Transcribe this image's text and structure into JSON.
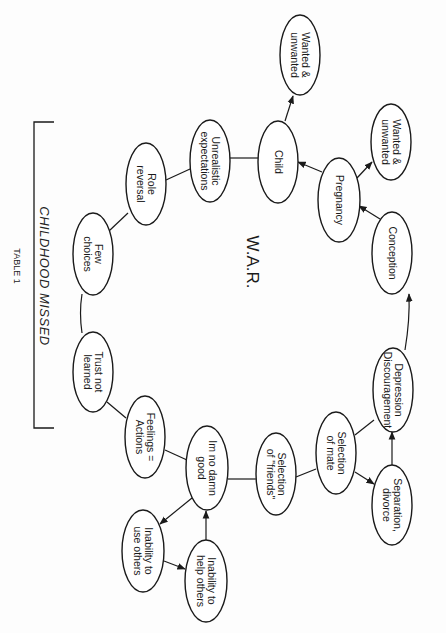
{
  "diagram": {
    "center_label": "W.A.R.",
    "bracket_label": "CHILDHOOD MISSED",
    "table_label": "TABLE 1",
    "colors": {
      "stroke": "#1a1a1a",
      "fill": "#ffffff",
      "background": "#fdfdfd"
    },
    "nodes": [
      {
        "id": "wanted_top",
        "lines": [
          "Wanted &",
          "unwanted"
        ],
        "cx": 300,
        "cy": 55,
        "rx": 20,
        "ry": 40
      },
      {
        "id": "wanted_right",
        "lines": [
          "Wanted &",
          "unwanted"
        ],
        "cx": 391,
        "cy": 142,
        "rx": 20,
        "ry": 38
      },
      {
        "id": "child",
        "lines": [
          "Child"
        ],
        "cx": 278,
        "cy": 162,
        "rx": 20,
        "ry": 41
      },
      {
        "id": "pregnancy",
        "lines": [
          "Pregnancy"
        ],
        "cx": 339,
        "cy": 200,
        "rx": 21,
        "ry": 42
      },
      {
        "id": "conception",
        "lines": [
          "Conception"
        ],
        "cx": 392,
        "cy": 253,
        "rx": 20,
        "ry": 41
      },
      {
        "id": "depression",
        "lines": [
          "Depression",
          "Discouragement"
        ],
        "cx": 393,
        "cy": 390,
        "rx": 20,
        "ry": 42
      },
      {
        "id": "separation",
        "lines": [
          "Separation,",
          "divorce"
        ],
        "cx": 392,
        "cy": 505,
        "rx": 20,
        "ry": 40
      },
      {
        "id": "selection_mate",
        "lines": [
          "Selection",
          "of mate"
        ],
        "cx": 336,
        "cy": 453,
        "rx": 20,
        "ry": 41
      },
      {
        "id": "selection_friends",
        "lines": [
          "Selection",
          "of \"friends\""
        ],
        "cx": 276,
        "cy": 474,
        "rx": 20,
        "ry": 41
      },
      {
        "id": "no_damn_good",
        "lines": [
          "Im no damn",
          "good"
        ],
        "cx": 207,
        "cy": 468,
        "rx": 21,
        "ry": 42
      },
      {
        "id": "inability_help",
        "lines": [
          "Inability  to",
          "help others"
        ],
        "cx": 206,
        "cy": 581,
        "rx": 21,
        "ry": 41
      },
      {
        "id": "inability_use",
        "lines": [
          "Inability to",
          "use others"
        ],
        "cx": 143,
        "cy": 551,
        "rx": 21,
        "ry": 41
      },
      {
        "id": "feelings_actions",
        "lines": [
          "Feelings =",
          "Actions"
        ],
        "cx": 145,
        "cy": 437,
        "rx": 20,
        "ry": 41
      },
      {
        "id": "trust_not_learned",
        "lines": [
          "Trust not",
          "learned"
        ],
        "cx": 93,
        "cy": 372,
        "rx": 20,
        "ry": 40
      },
      {
        "id": "few_choices",
        "lines": [
          "Few",
          "choices"
        ],
        "cx": 93,
        "cy": 254,
        "rx": 20,
        "ry": 41
      },
      {
        "id": "role_reversal",
        "lines": [
          "Role",
          "reversal"
        ],
        "cx": 146,
        "cy": 184,
        "rx": 20,
        "ry": 41
      },
      {
        "id": "unrealistic",
        "lines": [
          "Unrealistic",
          "expectations"
        ],
        "cx": 210,
        "cy": 161,
        "rx": 20,
        "ry": 41
      }
    ],
    "edges": [
      {
        "from": "child",
        "to": "wanted_top",
        "arrow": true,
        "x1": 285,
        "y1": 121,
        "x2": 293,
        "y2": 96
      },
      {
        "from": "pregnancy",
        "to": "wanted_right",
        "arrow": true,
        "x1": 357,
        "y1": 178,
        "x2": 372,
        "y2": 162
      },
      {
        "from": "pregnancy",
        "to": "child",
        "arrow": true,
        "x1": 322,
        "y1": 172,
        "x2": 298,
        "y2": 162
      },
      {
        "from": "conception",
        "to": "pregnancy",
        "arrow": true,
        "x1": 380,
        "y1": 219,
        "x2": 359,
        "y2": 206
      },
      {
        "from": "depression",
        "to": "conception",
        "arrow": true,
        "x1": 405,
        "y1": 350,
        "x2": 409,
        "y2": 294,
        "curve": "M 405 350 Q 410 320 409 294"
      },
      {
        "from": "separation",
        "to": "depression",
        "arrow": true,
        "x1": 392,
        "y1": 465,
        "x2": 392,
        "y2": 432
      },
      {
        "from": "selection_mate",
        "to": "separation",
        "arrow": true,
        "x1": 355,
        "y1": 472,
        "x2": 374,
        "y2": 484
      },
      {
        "from": "selection_mate",
        "to": "depression",
        "arrow": false,
        "x1": 355,
        "y1": 435,
        "x2": 374,
        "y2": 420
      },
      {
        "from": "selection_friends",
        "to": "selection_mate",
        "arrow": false,
        "x1": 296,
        "y1": 477,
        "x2": 316,
        "y2": 469
      },
      {
        "from": "no_damn_good",
        "to": "selection_friends",
        "arrow": false,
        "x1": 228,
        "y1": 479,
        "x2": 256,
        "y2": 479
      },
      {
        "from": "inability_help",
        "to": "no_damn_good",
        "arrow": true,
        "x1": 206,
        "y1": 540,
        "x2": 206,
        "y2": 511
      },
      {
        "from": "no_damn_good",
        "to": "inability_use",
        "arrow": true,
        "x1": 192,
        "y1": 498,
        "x2": 160,
        "y2": 524
      },
      {
        "from": "inability_use",
        "to": "inability_help",
        "arrow": true,
        "x1": 164,
        "y1": 561,
        "x2": 185,
        "y2": 569
      },
      {
        "from": "feelings_actions",
        "to": "no_damn_good",
        "arrow": false,
        "x1": 165,
        "y1": 450,
        "x2": 187,
        "y2": 460
      },
      {
        "from": "trust_not_learned",
        "to": "feelings_actions",
        "arrow": false,
        "x1": 107,
        "y1": 402,
        "x2": 126,
        "y2": 418
      },
      {
        "from": "few_choices",
        "to": "trust_not_learned",
        "arrow": false,
        "x1": 82,
        "y1": 294,
        "x2": 82,
        "y2": 333,
        "curve": "M 82 294 Q 79 313 82 333"
      },
      {
        "from": "role_reversal",
        "to": "few_choices",
        "arrow": false,
        "x1": 128,
        "y1": 213,
        "x2": 109,
        "y2": 231
      },
      {
        "from": "unrealistic",
        "to": "role_reversal",
        "arrow": false,
        "x1": 190,
        "y1": 169,
        "x2": 166,
        "y2": 180
      },
      {
        "from": "child",
        "to": "unrealistic",
        "arrow": false,
        "x1": 258,
        "y1": 158,
        "x2": 230,
        "y2": 158
      }
    ],
    "bracket": {
      "x": 34,
      "y_top": 122,
      "y_bottom": 428,
      "tick_len": 20
    }
  }
}
